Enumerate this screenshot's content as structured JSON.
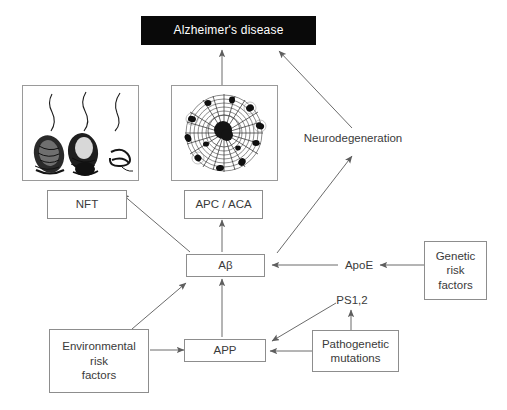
{
  "diagram": {
    "title_node": {
      "label": "Alzheimer's disease"
    },
    "nodes": {
      "nft": {
        "label": "NFT"
      },
      "apc_aca": {
        "label": "APC / ACA"
      },
      "abeta": {
        "label": "Aβ"
      },
      "app": {
        "label": "APP"
      },
      "apoe": {
        "label": "ApoE"
      },
      "ps12": {
        "label": "PS1,2"
      },
      "neurodegeneration": {
        "label": "Neurodegeneration"
      },
      "genetic_risk": {
        "label": "Genetic\nrisk\nfactors"
      },
      "environmental_risk": {
        "label": "Environmental\nrisk\nfactors"
      },
      "pathogenetic_mutations": {
        "label": "Pathogenetic\nmutations"
      }
    },
    "panels": {
      "nft_image": {
        "name": "neurofibrillary-tangle-micrograph",
        "caption_for": "NFT"
      },
      "plaque_image": {
        "name": "amyloid-plaque-micrograph",
        "caption_for": "APC / ACA"
      }
    },
    "colors": {
      "title_background": "#090909",
      "title_text": "#ffffff",
      "box_border": "#8d8d8d",
      "panel_border": "#9a9a9a",
      "arrow": "#6b6b6b",
      "text": "#3a3a3a",
      "background": "#ffffff"
    }
  }
}
